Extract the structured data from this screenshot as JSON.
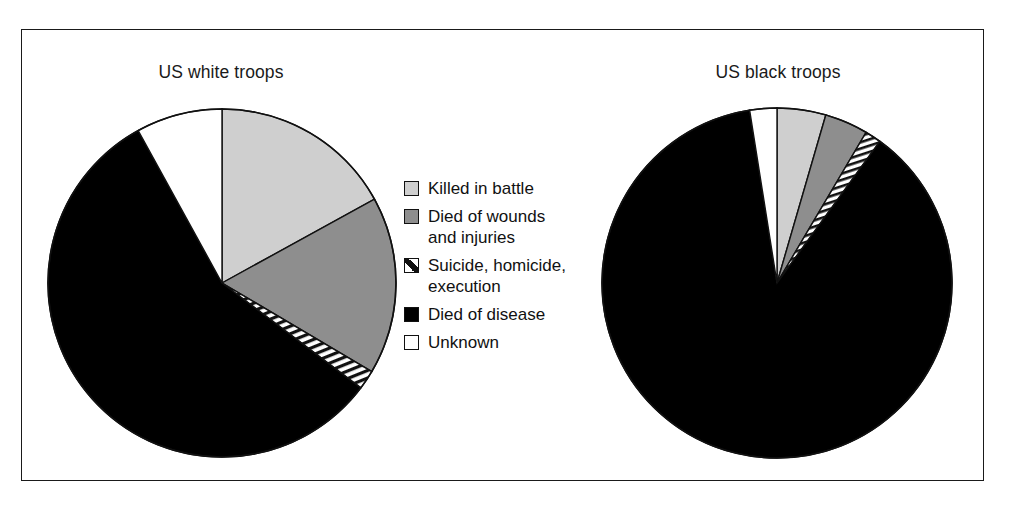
{
  "figure": {
    "background": "#ffffff",
    "frame_color": "#1a1a1a"
  },
  "charts": [
    {
      "id": "us-white-troops",
      "title": "US white troops"
    },
    {
      "id": "us-black-troops",
      "title": "US black troops"
    }
  ],
  "legend": {
    "items": [
      {
        "key": "killed_in_battle",
        "label": "Killed in battle",
        "swatch": "light",
        "color": "#cfcfcf"
      },
      {
        "key": "died_of_wounds",
        "label": "Died of wounds\nand injuries",
        "swatch": "mid",
        "color": "#8e8e8e"
      },
      {
        "key": "suicide_homicide",
        "label": "Suicide, homicide,\nexecution",
        "swatch": "hatch",
        "color": "#ffffff"
      },
      {
        "key": "died_of_disease",
        "label": "Died of disease",
        "swatch": "black",
        "color": "#000000"
      },
      {
        "key": "unknown",
        "label": "Unknown",
        "swatch": "white",
        "color": "#ffffff"
      }
    ]
  },
  "chart_data": [
    {
      "type": "pie",
      "title": "US white troops",
      "categories": [
        "Killed in battle",
        "Died of wounds and injuries",
        "Suicide, homicide, execution",
        "Died of disease",
        "Unknown"
      ],
      "values": [
        17.0,
        16.5,
        1.8,
        56.7,
        8.0
      ],
      "units": "percent",
      "colors": [
        "#cfcfcf",
        "#8e8e8e",
        "hatched",
        "#000000",
        "#ffffff"
      ],
      "start_angle_deg": 0,
      "direction": "clockwise",
      "legend_position": "center",
      "grid": false
    },
    {
      "type": "pie",
      "title": "US black troops",
      "categories": [
        "Killed in battle",
        "Died of wounds and injuries",
        "Suicide, homicide, execution",
        "Died of disease",
        "Unknown"
      ],
      "values": [
        4.5,
        4.0,
        1.5,
        87.5,
        2.5
      ],
      "units": "percent",
      "colors": [
        "#cfcfcf",
        "#8e8e8e",
        "hatched",
        "#000000",
        "#ffffff"
      ],
      "start_angle_deg": 0,
      "direction": "clockwise",
      "legend_position": "center",
      "grid": false
    }
  ]
}
